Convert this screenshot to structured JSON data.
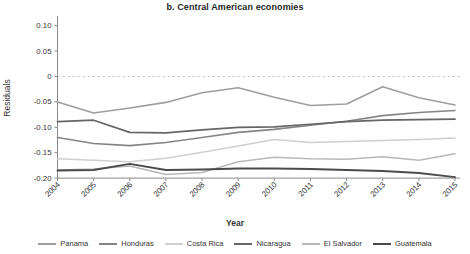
{
  "chart_data": {
    "type": "line",
    "title": "b. Central American economies",
    "xlabel": "Year",
    "ylabel": "Residuals",
    "x": [
      2004,
      2005,
      2006,
      2007,
      2008,
      2009,
      2010,
      2011,
      2012,
      2013,
      2014,
      2015
    ],
    "ylim": [
      -0.2,
      0.1
    ],
    "yticks": [
      {
        "value": 0.1,
        "label": "0.10"
      },
      {
        "value": 0.05,
        "label": "0.05"
      },
      {
        "value": 0.0,
        "label": "0"
      },
      {
        "value": -0.05,
        "label": "-0.05"
      },
      {
        "value": -0.1,
        "label": "-0.10"
      },
      {
        "value": -0.15,
        "label": "-0.15"
      },
      {
        "value": -0.2,
        "label": "-0.20"
      }
    ],
    "zero_line": "dashed",
    "grid": false,
    "legend_position": "bottom",
    "series": [
      {
        "name": "Panama",
        "color": "#9e9e9e",
        "width": 1.6,
        "values": [
          -0.05,
          -0.072,
          -0.062,
          -0.051,
          -0.032,
          -0.022,
          -0.041,
          -0.057,
          -0.054,
          -0.02,
          -0.042,
          -0.056
        ]
      },
      {
        "name": "Honduras",
        "color": "#858585",
        "width": 1.6,
        "values": [
          -0.12,
          -0.132,
          -0.136,
          -0.13,
          -0.12,
          -0.11,
          -0.104,
          -0.096,
          -0.088,
          -0.077,
          -0.071,
          -0.067
        ]
      },
      {
        "name": "Costa Rica",
        "color": "#cfcfcf",
        "width": 1.5,
        "values": [
          -0.162,
          -0.165,
          -0.168,
          -0.161,
          -0.149,
          -0.137,
          -0.124,
          -0.13,
          -0.128,
          -0.126,
          -0.124,
          -0.121
        ]
      },
      {
        "name": "Nicaragua",
        "color": "#666666",
        "width": 1.7,
        "values": [
          -0.089,
          -0.086,
          -0.11,
          -0.111,
          -0.105,
          -0.1,
          -0.099,
          -0.094,
          -0.089,
          -0.086,
          -0.085,
          -0.084
        ]
      },
      {
        "name": "El Salvador",
        "color": "#b8b8b8",
        "width": 1.5,
        "values": [
          -0.184,
          -0.182,
          -0.176,
          -0.193,
          -0.189,
          -0.168,
          -0.159,
          -0.162,
          -0.163,
          -0.158,
          -0.165,
          -0.152
        ]
      },
      {
        "name": "Guatemala",
        "color": "#4b4b4b",
        "width": 1.9,
        "values": [
          -0.185,
          -0.184,
          -0.172,
          -0.184,
          -0.183,
          -0.181,
          -0.181,
          -0.182,
          -0.184,
          -0.186,
          -0.19,
          -0.198
        ]
      }
    ]
  }
}
